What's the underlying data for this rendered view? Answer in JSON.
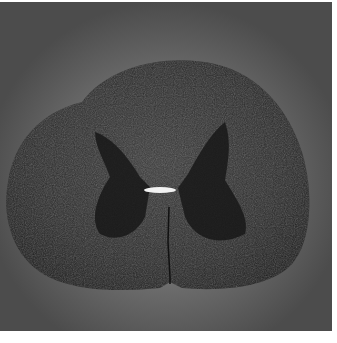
{
  "image": {
    "subject": "Transverse section of spinal cord (microscopy)",
    "background_color": "#6b6b6b",
    "tissue_color": "#2a2a2a",
    "gray_matter_color": "#1a1a1a",
    "central_canal_color": "#f2f2f2",
    "border_color": "#ffffff"
  }
}
